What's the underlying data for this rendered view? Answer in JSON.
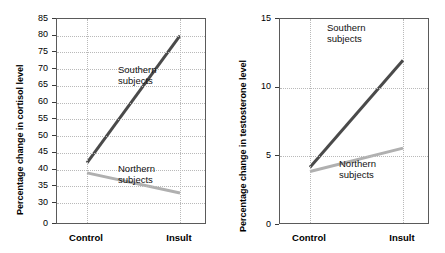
{
  "chart_data": [
    {
      "type": "line",
      "title": "",
      "xlabel": "",
      "ylabel": "Percentage change in cortisol level",
      "categories": [
        "Control",
        "Insult"
      ],
      "x": [
        0,
        1
      ],
      "ylim": [
        30,
        85
      ],
      "yticks": [
        0,
        30,
        35,
        40,
        45,
        50,
        55,
        60,
        65,
        70,
        75,
        80,
        85
      ],
      "ytick_labels": [
        "0",
        "30",
        "35",
        "40",
        "45",
        "50",
        "55",
        "60",
        "65",
        "70",
        "75",
        "80",
        "85"
      ],
      "axis_break": true,
      "grid": "dotted",
      "legend": "inline-annotations",
      "series": [
        {
          "name": "Southern subjects",
          "values": [
            42,
            80
          ],
          "color": "#4a4a4a",
          "annotation": "Southern\nsubjects",
          "annotation_line1": "Southern",
          "annotation_line2": "subjects"
        },
        {
          "name": "Northern subjects",
          "values": [
            39,
            33
          ],
          "color": "#b0b0b0",
          "annotation": "Northern\nsubjects",
          "annotation_line1": "Northern",
          "annotation_line2": "subjects"
        }
      ]
    },
    {
      "type": "line",
      "title": "",
      "xlabel": "",
      "ylabel": "Percentage change in testosterone level",
      "categories": [
        "Control",
        "Insult"
      ],
      "x": [
        0,
        1
      ],
      "ylim": [
        0,
        15
      ],
      "yticks": [
        0,
        5,
        10,
        15
      ],
      "ytick_labels": [
        "0",
        "5",
        "10",
        "15"
      ],
      "axis_break": false,
      "grid": "dotted",
      "legend": "inline-annotations",
      "series": [
        {
          "name": "Southern subjects",
          "values": [
            4.2,
            12.0
          ],
          "color": "#4a4a4a",
          "annotation": "Southern\nsubjects",
          "annotation_line1": "Southern",
          "annotation_line2": "subjects"
        },
        {
          "name": "Northern subjects",
          "values": [
            3.9,
            5.6
          ],
          "color": "#b0b0b0",
          "annotation": "Northern\nsubjects",
          "annotation_line1": "Northern",
          "annotation_line2": "subjects"
        }
      ]
    }
  ],
  "left_chart": {
    "ylabel": "Percentage change in cortisol level",
    "ytick_labels": [
      "85",
      "80",
      "75",
      "70",
      "65",
      "60",
      "55",
      "50",
      "45",
      "40",
      "35",
      "30",
      "0"
    ],
    "xtick_labels": [
      "Control",
      "Insult"
    ],
    "southern_label_1": "Southern",
    "southern_label_2": "subjects",
    "northern_label_1": "Northern",
    "northern_label_2": "subjects"
  },
  "right_chart": {
    "ylabel": "Percentage change in testosterone level",
    "ytick_labels": [
      "15",
      "10",
      "5",
      "0"
    ],
    "xtick_labels": [
      "Control",
      "Insult"
    ],
    "southern_label_1": "Southern",
    "southern_label_2": "subjects",
    "northern_label_1": "Northern",
    "northern_label_2": "subjects"
  },
  "colors": {
    "southern_line": "#4a4a4a",
    "northern_line": "#b0b0b0",
    "axis": "#5a5a5a",
    "grid": "#b9b9b9",
    "text": "#000000",
    "background": "#ffffff"
  }
}
